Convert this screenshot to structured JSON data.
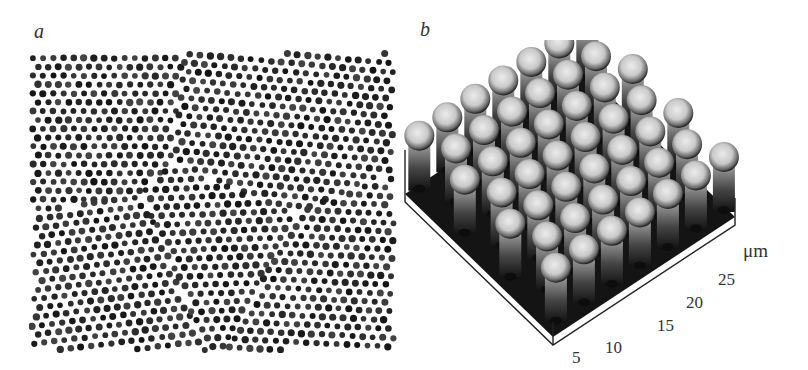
{
  "figure": {
    "panels": [
      {
        "id": "a",
        "label": "a",
        "description": "Top-view micrograph of a hexagonally packed dot array (honeycomb/breath-figure pattern) with grain boundaries",
        "scale_bar_label": ""
      },
      {
        "id": "b",
        "label": "b",
        "description": "3D AFM topography of hexagonally ordered pillar array",
        "axis": {
          "unit": "μm",
          "ticks": [
            "5",
            "10",
            "15",
            "20",
            "25"
          ]
        }
      }
    ],
    "colors": {
      "dots": "#1a1a1a",
      "background": "#ffffff",
      "pillar_highlight": "#e6e6e6",
      "pillar_shadow": "#0f0f0f"
    }
  },
  "chart_data": {
    "type": "heatmap",
    "title": "",
    "xlabel": "μm",
    "ylabel": "",
    "x_ticks": [
      5,
      10,
      15,
      20,
      25
    ],
    "x_range": [
      0,
      27
    ],
    "grid": false,
    "legend": "none"
  }
}
